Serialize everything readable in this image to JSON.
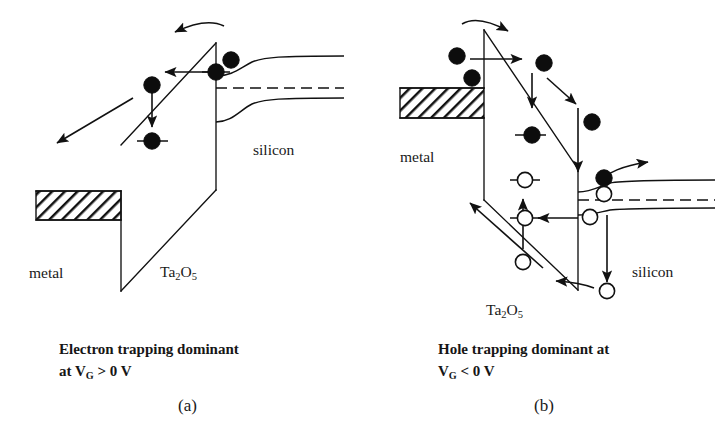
{
  "figure": {
    "background_color": "#ffffff",
    "line_color": "#111111",
    "electron_fill": "#0d0d0d",
    "hole_fill": "#ffffff"
  },
  "panels": [
    {
      "id": "a",
      "letter": "(a)",
      "caption_line1": "Electron trapping dominant",
      "caption_line2_prefix": "at V",
      "caption_line2_sub": "G",
      "caption_line2_suffix": " > 0 V",
      "bias_condition": "VG > 0 V",
      "dominant_process": "Electron trapping",
      "labels": {
        "metal": "metal",
        "insulator": "Ta",
        "insulator_sub1": "2",
        "insulator_mid": "O",
        "insulator_sub2": "5",
        "semiconductor": "silicon"
      },
      "carriers": {
        "electrons": 4,
        "holes": 0,
        "trapped_electrons": 2
      },
      "band_bending": "upward at silicon surface",
      "oxide_field_direction": "conduction band slopes up toward silicon"
    },
    {
      "id": "b",
      "letter": "(b)",
      "caption_line1": "Hole trapping dominant at",
      "caption_line2_prefix": "V",
      "caption_line2_sub": "G",
      "caption_line2_suffix": " < 0 V",
      "bias_condition": "VG < 0 V",
      "dominant_process": "Hole trapping",
      "labels": {
        "metal": "metal",
        "insulator": "Ta",
        "insulator_sub1": "2",
        "insulator_mid": "O",
        "insulator_sub2": "5",
        "semiconductor": "silicon"
      },
      "carriers": {
        "electrons": 5,
        "holes": 5,
        "trapped_electrons": 1,
        "trapped_holes": 2
      },
      "band_bending": "downward at silicon surface",
      "oxide_field_direction": "conduction band slopes down toward silicon"
    }
  ],
  "icons": {
    "electron": "filled-circle-icon",
    "hole": "open-circle-icon",
    "injection_arrow": "arrow-icon",
    "curved_arrow": "curved-arrow-icon",
    "hatch": "hatched-fill-icon"
  }
}
